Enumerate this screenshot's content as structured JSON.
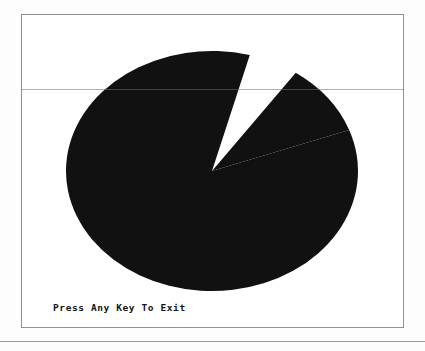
{
  "screen": {
    "title": "Pie Chart Display",
    "prompt": "Press Any Key To Exit",
    "background_color": "#ffffff",
    "frame_color": "#8d9095",
    "ink_color": "#111111"
  },
  "page": {
    "surface_color": "#fdfdfd",
    "rule_color": "#9a9da1"
  },
  "chart_data": {
    "type": "pie",
    "title": "",
    "subtitle": "",
    "xlabel": "",
    "ylabel": "",
    "grid": false,
    "legend_position": "none",
    "center": {
      "x": 190,
      "y": 156
    },
    "radius_x": 146,
    "radius_y": 120,
    "exploded": true,
    "gap_degrees": 20,
    "categories": [
      "Slice 1",
      "Slice 2"
    ],
    "values": [
      305,
      35
    ],
    "percentages": [
      89.7,
      10.3
    ],
    "slices": [
      {
        "label": "Slice 1",
        "value": 305,
        "percent": 89.7,
        "start_angle": 75,
        "end_angle": 380,
        "color": "#111111"
      },
      {
        "label": "Slice 2",
        "value": 35,
        "percent": 10.3,
        "start_angle": 20,
        "end_angle": 55,
        "color": "#111111"
      }
    ]
  }
}
